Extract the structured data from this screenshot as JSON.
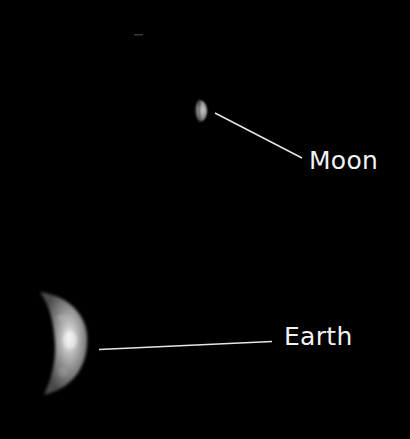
{
  "image": {
    "description": "Earth and Moon crescents photographed from space against black background",
    "background_color": "#000000"
  },
  "labels": {
    "moon": "Moon",
    "earth": "Earth"
  },
  "colors": {
    "label_text": "#f2f2f2",
    "pointer_line": "#e6e6e6",
    "planet_gray": "#8a8a8a"
  }
}
